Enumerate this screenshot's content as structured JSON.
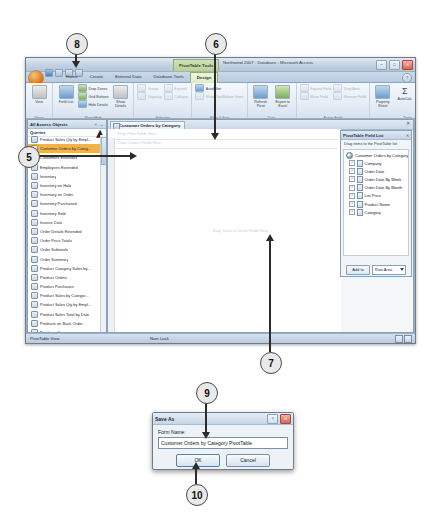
{
  "callouts": [
    {
      "id": "8",
      "label": "8"
    },
    {
      "id": "6",
      "label": "6"
    },
    {
      "id": "5",
      "label": "5"
    },
    {
      "id": "7",
      "label": "7"
    },
    {
      "id": "9",
      "label": "9"
    },
    {
      "id": "10",
      "label": "10"
    }
  ],
  "window": {
    "context_tab": "PivotTable Tools",
    "title": "Northwind 2007 : Database - Microsoft Access",
    "minimize": "─",
    "maximize": "□",
    "close": "✕",
    "help": "?"
  },
  "ribbon": {
    "tabs": [
      {
        "label": "Home",
        "selected": false
      },
      {
        "label": "Create",
        "selected": false
      },
      {
        "label": "External Data",
        "selected": false
      },
      {
        "label": "Database Tools",
        "selected": false
      },
      {
        "label": "Design",
        "selected": true
      }
    ],
    "groups": [
      {
        "name": "Views",
        "big": [
          {
            "label": "View"
          }
        ]
      },
      {
        "name": "Show/Hide",
        "big": [
          {
            "label": "Field List"
          },
          {
            "label": "Show Details"
          }
        ],
        "small": [
          {
            "label": "Drop Zones",
            "dim": false
          },
          {
            "label": "Grid Buttons",
            "dim": false
          },
          {
            "label": "Hide Details",
            "dim": false
          }
        ]
      },
      {
        "name": "Selection",
        "small": [
          {
            "label": "Group",
            "dim": true
          },
          {
            "label": "Ungroup",
            "dim": true
          },
          {
            "label": "Expand",
            "dim": true
          },
          {
            "label": "Collapse",
            "dim": true
          }
        ]
      },
      {
        "name": "Filter & Sort",
        "small": [
          {
            "label": "AutoFilter",
            "dim": false
          },
          {
            "label": "Show Top/Bottom Items",
            "dim": true
          }
        ]
      },
      {
        "name": "Data",
        "big": [
          {
            "label": "Refresh Pivot"
          },
          {
            "label": "Export to Excel"
          }
        ]
      },
      {
        "name": "Active Field",
        "small": [
          {
            "label": "Expand Field",
            "dim": true
          },
          {
            "label": "Move Field",
            "dim": true
          },
          {
            "label": "Drop Area",
            "dim": true
          },
          {
            "label": "Remove Field",
            "dim": true
          }
        ]
      },
      {
        "name": "Tools",
        "big": [
          {
            "label": "Property Sheet"
          },
          {
            "label": "AutoCalc"
          }
        ],
        "small": [
          {
            "label": "Subtotal",
            "dim": true
          },
          {
            "label": "Formulas",
            "dim": false
          },
          {
            "label": "Show As",
            "dim": true
          }
        ]
      }
    ]
  },
  "navigation_pane": {
    "title": "All Access Objects",
    "collapse_icon": "« ⌄",
    "group_label": "Queries",
    "items": [
      {
        "label": "Product Sales Qty by Empl...",
        "selected": false
      },
      {
        "label": "Customer Orders by Categ...",
        "selected": true
      },
      {
        "label": "Customers Extended",
        "selected": false
      },
      {
        "label": "Employees Extended",
        "selected": false
      },
      {
        "label": "Inventory",
        "selected": false
      },
      {
        "label": "Inventory on Hold",
        "selected": false
      },
      {
        "label": "Inventory on Order",
        "selected": false
      },
      {
        "label": "Inventory Purchased",
        "selected": false
      },
      {
        "label": "Inventory Sold",
        "selected": false
      },
      {
        "label": "Invoice Data",
        "selected": false
      },
      {
        "label": "Order Details Extended",
        "selected": false
      },
      {
        "label": "Order Price Totals",
        "selected": false
      },
      {
        "label": "Order Subtotals",
        "selected": false
      },
      {
        "label": "Order Summary",
        "selected": false
      },
      {
        "label": "Product Category Sales by...",
        "selected": false
      },
      {
        "label": "Product Orders",
        "selected": false
      },
      {
        "label": "Product Purchases",
        "selected": false
      },
      {
        "label": "Product Sales by Categor...",
        "selected": false
      },
      {
        "label": "Product Sales Qty by Empl...",
        "selected": false
      },
      {
        "label": "Product Sales Total by Date",
        "selected": false
      },
      {
        "label": "Products on Back Order",
        "selected": false
      },
      {
        "label": "Products Query",
        "selected": false
      },
      {
        "label": "Purchase Details Extended",
        "selected": false
      }
    ]
  },
  "document": {
    "tab_label": "Customer Orders by Category",
    "close_label": "✕",
    "drop_zones": [
      "Drop Filter Fields Here",
      "Drop Column Fields Here",
      "Drop Totals or Detail Fields Here"
    ]
  },
  "field_list": {
    "title": "PivotTable Field List",
    "close_label": "✕",
    "instruction": "Drag items to the PivotTable list",
    "root": "Customer Orders by Category",
    "fields": [
      "Company",
      "Order Date",
      "Order Date By Week",
      "Order Date By Month",
      "List Price",
      "Product Name",
      "Category"
    ],
    "expand_glyph": "+",
    "add_to_label": "Add to",
    "area_value": "Row Area"
  },
  "status_bar": {
    "view_label": "PivotTable View",
    "num_lock": "Num Lock"
  },
  "save_dialog": {
    "title": "Save As",
    "help_label": "?",
    "close_label": "✕",
    "field_label": "Form Name:",
    "field_value": "Customer Orders by Category PivotTable",
    "ok_label": "OK",
    "cancel_label": "Cancel"
  }
}
